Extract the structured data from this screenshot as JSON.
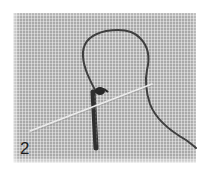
{
  "image": {
    "description": "Embroidery instruction photo: needle passing through even-weave fabric with a looped thread and a vertical stitch",
    "step_number": "2",
    "colors": {
      "background": "#ffffff",
      "fabric": "#a9a9a9",
      "thread": "#3a3a3a",
      "needle": "#e6e6e6",
      "label": "#1e1e1e"
    },
    "elements": {
      "fabric": "even-weave-fabric",
      "thread_loop": "thread-loop",
      "stitch": "vertical-stitch",
      "needle": "needle",
      "thread_tail": "thread-tail"
    }
  }
}
